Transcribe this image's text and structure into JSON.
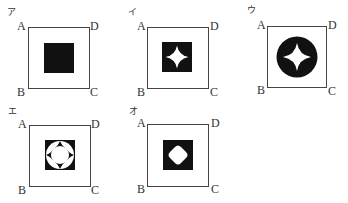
{
  "figures": [
    {
      "id": "a",
      "option_label": "ア",
      "vertices": {
        "A": "A",
        "B": "B",
        "C": "C",
        "D": "D"
      },
      "shape": "black-square"
    },
    {
      "id": "i",
      "option_label": "イ",
      "vertices": {
        "A": "A",
        "B": "B",
        "C": "C",
        "D": "D"
      },
      "shape": "black-square-with-white-four-point-star"
    },
    {
      "id": "u",
      "option_label": "ウ",
      "vertices": {
        "A": "A",
        "B": "B",
        "C": "C",
        "D": "D"
      },
      "shape": "black-circle-with-white-four-point-star"
    },
    {
      "id": "e",
      "option_label": "エ",
      "vertices": {
        "A": "A",
        "B": "B",
        "C": "C",
        "D": "D"
      },
      "shape": "black-square-with-white-ring-and-circle"
    },
    {
      "id": "o",
      "option_label": "オ",
      "vertices": {
        "A": "A",
        "B": "B",
        "C": "C",
        "D": "D"
      },
      "shape": "black-square-with-white-rounded-diamond"
    }
  ],
  "colors": {
    "fill": "#111111",
    "outline": "#444444",
    "background": "#ffffff"
  }
}
